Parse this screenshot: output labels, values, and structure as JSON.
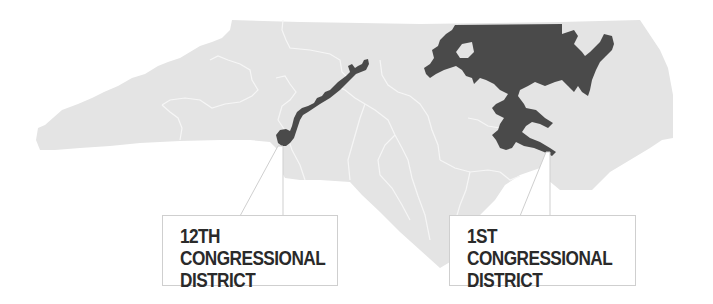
{
  "map": {
    "region": "North Carolina",
    "colors": {
      "state_fill": "#e4e4e4",
      "district_border": "#f4f4f4",
      "highlight_fill": "#4a4a4a",
      "callout_border": "#cfcfcf",
      "callout_text": "#2a2a2a",
      "background": "#ffffff"
    },
    "highlighted_districts": [
      "12th Congressional District",
      "1st Congressional District"
    ]
  },
  "callouts": [
    {
      "id": "12",
      "lines": [
        "12TH",
        "CONGRESSIONAL",
        "DISTRICT"
      ]
    },
    {
      "id": "1",
      "lines": [
        "1ST",
        "CONGRESSIONAL",
        "DISTRICT"
      ]
    }
  ]
}
